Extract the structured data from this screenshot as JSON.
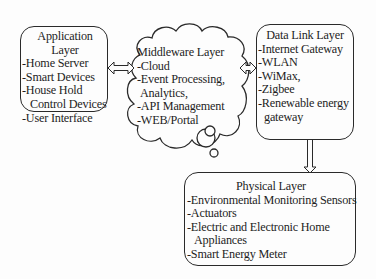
{
  "application_layer": {
    "title_line1": "Application",
    "title_line2": "Layer",
    "items": [
      "-Home Server",
      "-Smart Devices",
      "-House Hold",
      "Control Devices",
      "-User Interface"
    ]
  },
  "middleware_layer": {
    "title": "Middleware Layer",
    "items": [
      "-Cloud",
      "-Event Processing,",
      "Analytics,",
      "-API Management",
      "-WEB/Portal"
    ]
  },
  "data_link_layer": {
    "title": "Data Link Layer",
    "items": [
      "-Internet Gateway",
      "-WLAN",
      "-WiMax,",
      "-Zigbee",
      "-Renewable energy",
      "gateway"
    ]
  },
  "physical_layer": {
    "title": "Physical Layer",
    "items": [
      "-Environmental Monitoring Sensors",
      "-Actuators",
      "-Electric and Electronic Home",
      "Appliances",
      "-Smart Energy Meter"
    ]
  },
  "connectors": [
    {
      "from": "Application Layer",
      "to": "Middleware Layer",
      "type": "bidirectional"
    },
    {
      "from": "Middleware Layer",
      "to": "Data Link Layer",
      "type": "bidirectional"
    },
    {
      "from": "Data Link Layer",
      "to": "Physical Layer",
      "type": "bidirectional"
    }
  ]
}
